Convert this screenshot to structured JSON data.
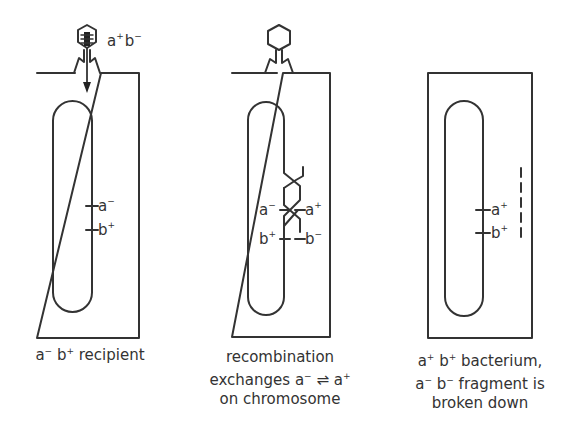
{
  "panels": [
    {
      "id": "recipient",
      "phage_label": {
        "base_a": "a",
        "sup_a": "+",
        "base_b": "b",
        "sup_b": "−"
      },
      "markers": [
        {
          "base": "a",
          "sup": "−"
        },
        {
          "base": "b",
          "sup": "+"
        }
      ],
      "caption": {
        "line1_a": "a",
        "line1_a_sup": "−",
        "line1_b": "b",
        "line1_b_sup": "+",
        "line1_rest": " recipient"
      }
    },
    {
      "id": "recombination",
      "markers_left": [
        {
          "base": "a",
          "sup": "−"
        },
        {
          "base": "b",
          "sup": "+"
        }
      ],
      "markers_right": [
        {
          "base": "a",
          "sup": "+"
        },
        {
          "base": "b",
          "sup": "−"
        }
      ],
      "caption": {
        "line1": "recombination",
        "line2_pre": "exchanges a",
        "line2_sup1": "−",
        "line2_arrow": " ⇌ a",
        "line2_sup2": "+",
        "line3": "on chromosome"
      }
    },
    {
      "id": "result",
      "markers": [
        {
          "base": "a",
          "sup": "+"
        },
        {
          "base": "b",
          "sup": "+"
        }
      ],
      "caption": {
        "l1_a": "a",
        "l1_a_sup": "+",
        "l1_b": "b",
        "l1_b_sup": "+",
        "l1_rest": " bacterium,",
        "l2_a": "a",
        "l2_a_sup": "−",
        "l2_b": "b",
        "l2_b_sup": "−",
        "l2_rest": " fragment is",
        "l3": "broken down"
      }
    }
  ]
}
